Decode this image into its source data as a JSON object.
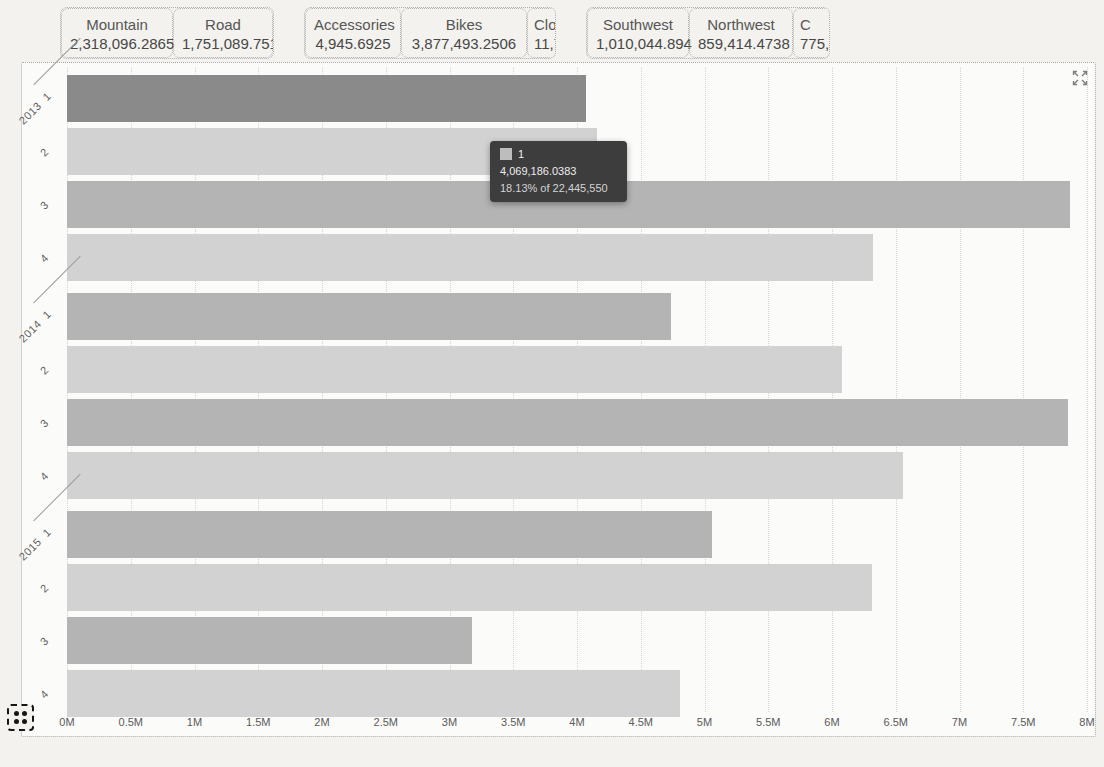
{
  "filter_cards": {
    "groups": [
      {
        "id": "subcategory",
        "cards": [
          {
            "label": "Mountain",
            "value": "2,318,096.2865"
          },
          {
            "label": "Road",
            "value": "1,751,089.7518"
          }
        ]
      },
      {
        "id": "category",
        "cards": [
          {
            "label": "Accessories",
            "value": "4,945.6925"
          },
          {
            "label": "Bikes",
            "value": "3,877,493.2506"
          },
          {
            "label": "Clo",
            "value": "11,76",
            "clipped": true
          }
        ]
      },
      {
        "id": "region",
        "cards": [
          {
            "label": "Southwest",
            "value": "1,010,044.894"
          },
          {
            "label": "Northwest",
            "value": "859,414.4738"
          },
          {
            "label": "C",
            "value": "775,",
            "clipped": true
          }
        ]
      }
    ]
  },
  "tooltip": {
    "series_label": "1",
    "value": "4,069,186.0383",
    "percent_line": "18.13% of 22,445,550",
    "marker_color": "#bdbdbd",
    "background": "#3d3d3d"
  },
  "chart_data": {
    "type": "bar",
    "orientation": "horizontal",
    "title": "",
    "xlabel": "",
    "ylabel": "",
    "xlim": [
      0,
      8000000
    ],
    "x_ticks": [
      "0M",
      "0.5M",
      "1M",
      "1.5M",
      "2M",
      "2.5M",
      "3M",
      "3.5M",
      "4M",
      "4.5M",
      "5M",
      "5.5M",
      "6M",
      "6.5M",
      "7M",
      "7.5M",
      "8M"
    ],
    "grid": true,
    "legend": "none",
    "categories": [
      "2013 Q1",
      "2013 Q2",
      "2013 Q3",
      "2013 Q4",
      "2014 Q1",
      "2014 Q2",
      "2014 Q3",
      "2014 Q4",
      "2015 Q1",
      "2015 Q2",
      "2015 Q3",
      "2015 Q4"
    ],
    "groups": [
      {
        "year": "2013",
        "quarters": [
          "1",
          "2",
          "3",
          "4"
        ],
        "values": [
          4069186,
          4160000,
          7870000,
          6320000
        ]
      },
      {
        "year": "2014",
        "quarters": [
          "1",
          "2",
          "3",
          "4"
        ],
        "values": [
          4740000,
          6080000,
          7850000,
          6560000
        ]
      },
      {
        "year": "2015",
        "quarters": [
          "1",
          "2",
          "3",
          "4"
        ],
        "values": [
          5060000,
          6310000,
          3180000,
          4810000
        ]
      }
    ],
    "highlighted_bar": {
      "year": "2013",
      "quarter": "1",
      "value": 4069186.0383,
      "percent_of_total": "18.13%",
      "total": 22445550
    },
    "bar_colors": {
      "odd_quarter": "#b4b4b4",
      "even_quarter": "#d2d2d2",
      "highlight": "#8a8a8a"
    },
    "axis_color": "#5a5a5a"
  },
  "icons": {
    "expand": "expand-icon",
    "grid_toggle": "grid-toggle-icon"
  }
}
